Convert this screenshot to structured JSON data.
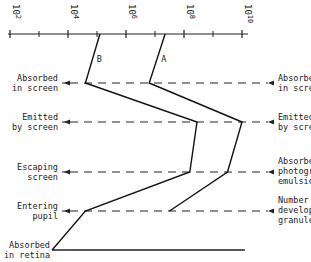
{
  "chart_data": {
    "type": "line",
    "title": "",
    "axis": {
      "scale": "log10",
      "range": [
        100,
        10000000000
      ],
      "tick_labels": [
        {
          "base": "10",
          "exp": "2",
          "value_log": 2
        },
        {
          "base": "10",
          "exp": "4",
          "value_log": 4
        },
        {
          "base": "10",
          "exp": "6",
          "value_log": 6
        },
        {
          "base": "10",
          "exp": "8",
          "value_log": 8
        },
        {
          "base": "10",
          "exp": "10",
          "value_log": 10
        }
      ],
      "minor_ticks_log": [
        3,
        5,
        7,
        9
      ]
    },
    "stages_left": [
      {
        "key": "abs_screen",
        "text": [
          "Absorbed",
          "in screen"
        ]
      },
      {
        "key": "emitted",
        "text": [
          "Emitted",
          "by screen"
        ]
      },
      {
        "key": "escaping",
        "text": [
          "Escaping",
          "screen"
        ]
      },
      {
        "key": "pupil",
        "text": [
          "Entering",
          "pupil"
        ]
      },
      {
        "key": "retina",
        "text": [
          "Absorbed",
          "in retina"
        ]
      }
    ],
    "stages_right": [
      {
        "key": "abs_screen",
        "text": [
          "Absorbed",
          "in screen"
        ]
      },
      {
        "key": "emitted",
        "text": [
          "Emitted",
          "by screen"
        ]
      },
      {
        "key": "escaping",
        "text": [
          "Absorbed in",
          "photographic",
          "emulsion"
        ]
      },
      {
        "key": "pupil",
        "text": [
          "Number of",
          "developable",
          "granules"
        ]
      }
    ],
    "series": [
      {
        "name": "B",
        "log_values": [
          5.1,
          4.6,
          8.45,
          8.2,
          4.6,
          3.45
        ],
        "points": [
          "incident",
          "abs_screen",
          "emitted",
          "escaping",
          "pupil",
          "retina"
        ]
      },
      {
        "name": "A",
        "log_values": [
          7.35,
          6.8,
          10.0,
          9.5,
          7.5
        ],
        "points": [
          "incident",
          "abs_screen",
          "emitted",
          "escaping",
          "pupil"
        ]
      }
    ],
    "retina_baseline_log_end": 10.1
  }
}
